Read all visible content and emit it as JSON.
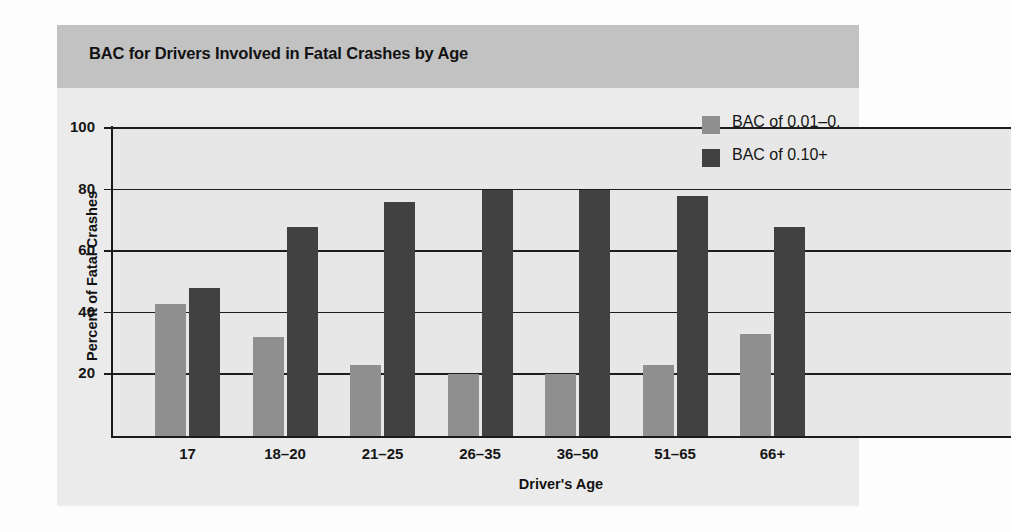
{
  "figure": {
    "title": "BAC for Drivers Involved in Fatal Crashes by Age",
    "title_band_color": "#c2c2c2",
    "panel_color": "#ebebeb",
    "plot_background": "#e7e7e7"
  },
  "legend": {
    "position": "top-right",
    "entries": [
      {
        "label": "BAC of 0.01–0.",
        "color": "#8f8f8f"
      },
      {
        "label": "BAC of 0.10+",
        "color": "#414141"
      }
    ]
  },
  "axes": {
    "ylabel": "Percent of Fatal Crashes",
    "xlabel": "Driver's Age",
    "yticks": [
      "100",
      "80",
      "60",
      "40",
      "20"
    ]
  },
  "chart_data": {
    "type": "bar",
    "title": "BAC for Drivers Involved in Fatal Crashes by Age",
    "xlabel": "Driver's Age",
    "ylabel": "Percent of Fatal Crashes",
    "categories": [
      "17",
      "18–20",
      "21–25",
      "26–35",
      "36–50",
      "51–65",
      "66+"
    ],
    "series": [
      {
        "name": "BAC of 0.01–0.",
        "color": "#8f8f8f",
        "values": [
          43,
          32,
          23,
          20,
          20,
          23,
          33
        ]
      },
      {
        "name": "BAC of 0.10+",
        "color": "#414141",
        "values": [
          48,
          68,
          76,
          80,
          80,
          78,
          68
        ]
      }
    ],
    "ylim": [
      0,
      100
    ],
    "ytick_values": [
      20,
      40,
      60,
      80,
      100
    ],
    "grid": "horizontal",
    "legend_position": "top-right"
  }
}
